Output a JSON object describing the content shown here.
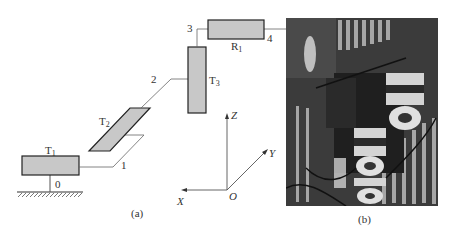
{
  "figure": {
    "panel_a": {
      "caption": "(a)",
      "joints": {
        "T1": {
          "main": "T",
          "sub": "1"
        },
        "T2": {
          "main": "T",
          "sub": "2"
        },
        "T3": {
          "main": "T",
          "sub": "3"
        },
        "R1": {
          "main": "R",
          "sub": "1"
        }
      },
      "node_labels": [
        "0",
        "1",
        "2",
        "3",
        "4"
      ],
      "axes": {
        "x": "X",
        "y": "Y",
        "z": "Z",
        "origin": "O"
      },
      "colors": {
        "link_fill": "#c8c8c8",
        "link_stroke": "#222222",
        "line": "#555555"
      }
    },
    "panel_b": {
      "caption": "(b)"
    }
  }
}
